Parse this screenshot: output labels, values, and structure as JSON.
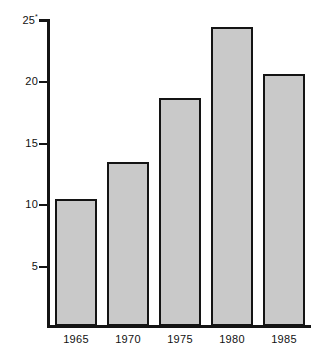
{
  "chart_data": {
    "type": "bar",
    "title": "",
    "subtitle": "",
    "xlabel": "",
    "ylabel": "",
    "categories": [
      "1965",
      "1970",
      "1975",
      "1980",
      "1985"
    ],
    "values": [
      10.4,
      13.4,
      18.6,
      24.4,
      20.6
    ],
    "ylim": [
      0,
      25
    ],
    "yticks": [
      5,
      10,
      15,
      20,
      25
    ],
    "ytick_labels": [
      "5",
      "10",
      "15",
      "20",
      "25"
    ],
    "top_tick_superscript": "*",
    "grid": false,
    "legend": null,
    "bar_fill_color": "#c9c9c9",
    "bar_edge_color": "#141414",
    "axis_color": "#141414",
    "background_color": "#ffffff"
  },
  "axis": {
    "y_labels": [
      {
        "text": "25",
        "sup": "*"
      },
      {
        "text": "20",
        "sup": ""
      },
      {
        "text": "15",
        "sup": ""
      },
      {
        "text": "10",
        "sup": ""
      },
      {
        "text": "5",
        "sup": ""
      }
    ],
    "x_labels": [
      "1965",
      "1970",
      "1975",
      "1980",
      "1985"
    ]
  }
}
